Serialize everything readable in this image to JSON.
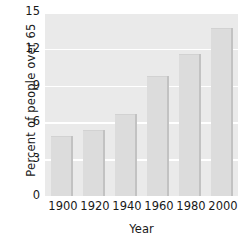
{
  "chart_data": {
    "type": "bar",
    "title": "",
    "subtitle": "",
    "xlabel": "Year",
    "ylabel": "Percent of people over 65",
    "categories": [
      "1900",
      "1920",
      "1940",
      "1960",
      "1980",
      "2000"
    ],
    "values": [
      4.9,
      5.4,
      6.7,
      9.8,
      11.6,
      13.7
    ],
    "series": [
      {
        "name": "Percent of people over 65",
        "values": [
          4.9,
          5.4,
          6.7,
          9.8,
          11.6,
          13.7
        ]
      }
    ],
    "ylim": [
      0,
      15
    ],
    "yticks": [
      0,
      3,
      6,
      9,
      12,
      15
    ],
    "ytick_labels": [
      "0",
      "3",
      "6",
      "9",
      "12",
      "15"
    ],
    "xtick_labels": [
      "1900",
      "1920",
      "1940",
      "1960",
      "1980",
      "2000"
    ],
    "grid": true,
    "grid_axis": "y",
    "legend": false,
    "legend_position": "none",
    "colors": {
      "plot_background": "#eaeaea",
      "figure_background": "#ffffff",
      "bar_fill": "#dcdcdc",
      "bar_edge": "#c2c2c2",
      "gridline": "#ffffff",
      "text": "#191919"
    }
  }
}
